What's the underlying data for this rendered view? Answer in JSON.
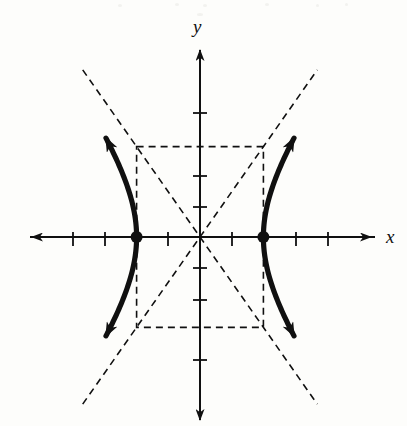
{
  "figure": {
    "kind": "hyperbola-graph",
    "background_color": "#fdfdfb",
    "stroke_color": "#101010",
    "width": 407,
    "height": 426
  },
  "axes": {
    "x_label": "x",
    "y_label": "y",
    "origin_px": [
      200,
      237
    ],
    "unit_px": 31.7,
    "x_axis_px": {
      "start": 28,
      "end": 375,
      "y": 237
    },
    "y_axis_px": {
      "start": 46,
      "end": 424,
      "x": 200
    },
    "tick_length_px": 9,
    "x_ticks_units": [
      -5,
      -4,
      -3,
      -2,
      -1,
      1,
      2,
      3,
      4,
      5
    ],
    "y_ticks_units": [
      -4,
      -3,
      -2,
      -1,
      1,
      2,
      3,
      4
    ],
    "tick_labels_shown": false,
    "arrowheads": [
      "left",
      "right",
      "up",
      "down"
    ]
  },
  "chart_data": {
    "type": "line",
    "title": "",
    "xlabel": "x",
    "ylabel": "y",
    "grid": false,
    "legend": null,
    "xlim": [
      -5.4,
      5.5
    ],
    "ylim": [
      -5.9,
      6.0
    ],
    "curve": {
      "name": "hyperbola",
      "equation": "x^2/4 - y^2/8 = 1",
      "orientation": "horizontal",
      "center": [
        0,
        0
      ],
      "a": 2,
      "b": 2.85,
      "vertices": [
        [
          -2,
          0
        ],
        [
          2,
          0
        ]
      ],
      "branches": [
        {
          "name": "left-branch",
          "points": [
            [
              -2.0,
              0.0
            ],
            [
              -2.05,
              -0.43
            ],
            [
              -2.2,
              -0.86
            ],
            [
              -2.45,
              -1.31
            ],
            [
              -2.8,
              -1.77
            ],
            [
              -3.25,
              -2.3
            ],
            [
              -3.8,
              -2.86
            ],
            [
              -4.0,
              -3.08
            ]
          ],
          "mirror_y": true,
          "arrow_ends": [
            "upper-left",
            "lower-left"
          ]
        },
        {
          "name": "right-branch",
          "points": [
            [
              2.0,
              0.0
            ],
            [
              2.05,
              0.43
            ],
            [
              2.2,
              0.86
            ],
            [
              2.45,
              1.31
            ],
            [
              2.8,
              1.77
            ],
            [
              3.25,
              2.3
            ],
            [
              3.8,
              2.86
            ],
            [
              4.0,
              3.08
            ]
          ],
          "mirror_y": true,
          "arrow_ends": [
            "upper-right",
            "lower-right"
          ]
        }
      ]
    },
    "asymptotes": [
      {
        "name": "asymptote-positive-slope",
        "equation": "y = 1.425x",
        "slope": 1.425,
        "intercept": 0
      },
      {
        "name": "asymptote-negative-slope",
        "equation": "y = -1.425x",
        "slope": -1.425,
        "intercept": 0
      }
    ],
    "reference_rectangle": {
      "name": "central-rectangle",
      "x_range": [
        -2,
        2
      ],
      "y_range": [
        -2.85,
        2.85
      ],
      "style": "dashed"
    },
    "marked_points": [
      {
        "label": "",
        "x": -2,
        "y": 0,
        "style": "filled-dot"
      },
      {
        "label": "",
        "x": 2,
        "y": 0,
        "style": "filled-dot"
      }
    ]
  },
  "styles": {
    "axis_stroke_width": 2,
    "curve_stroke_width": 5,
    "dash_stroke_width": 1.6,
    "dash_pattern": "7 5",
    "vertex_dot_radius": 6
  }
}
